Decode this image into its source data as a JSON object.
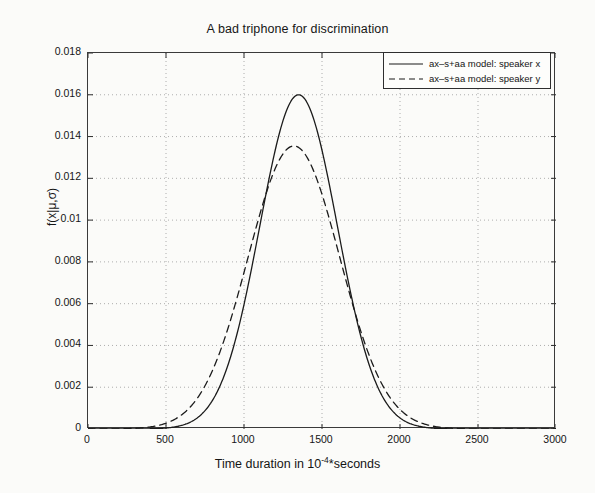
{
  "chart_data": {
    "type": "line",
    "title": "A bad triphone for discrimination",
    "xlabel_prefix": "Time duration in 10",
    "xlabel_exponent": "-4",
    "xlabel_suffix": "*seconds",
    "xlabel": "Time duration in 10^-4*seconds",
    "ylabel": "f(x|μ,σ)",
    "xlim": [
      0,
      3000
    ],
    "ylim": [
      0,
      0.018
    ],
    "xticks": [
      0,
      500,
      1000,
      1500,
      2000,
      2500,
      3000
    ],
    "xtick_labels": [
      "0",
      "500",
      "1000",
      "1500",
      "2000",
      "2500",
      "3000"
    ],
    "yticks": [
      0,
      0.002,
      0.004,
      0.006,
      0.008,
      0.01,
      0.012,
      0.014,
      0.016,
      0.018
    ],
    "ytick_labels": [
      "0",
      "0.002",
      "0.004",
      "0.006",
      "0.008",
      "0.01",
      "0.012",
      "0.014",
      "0.016",
      "0.018"
    ],
    "grid": true,
    "grid_style": "dotted",
    "legend_position": "top-right",
    "series": [
      {
        "name": "ax-s+aa model: speaker x",
        "style": "solid",
        "color": "#1b1b1b",
        "distribution": "gaussian",
        "mu": 1350,
        "sigma": 249,
        "peak": 0.016
      },
      {
        "name": "ax-s+aa model: speaker y",
        "style": "dashed",
        "color": "#1b1b1b",
        "distribution": "gaussian",
        "mu": 1320,
        "sigma": 294,
        "peak": 0.01355
      }
    ]
  },
  "legend": {
    "entries": [
      {
        "label": "ax–s+aa model: speaker x",
        "style": "solid"
      },
      {
        "label": "ax–s+aa model: speaker y",
        "style": "dashed"
      }
    ]
  }
}
